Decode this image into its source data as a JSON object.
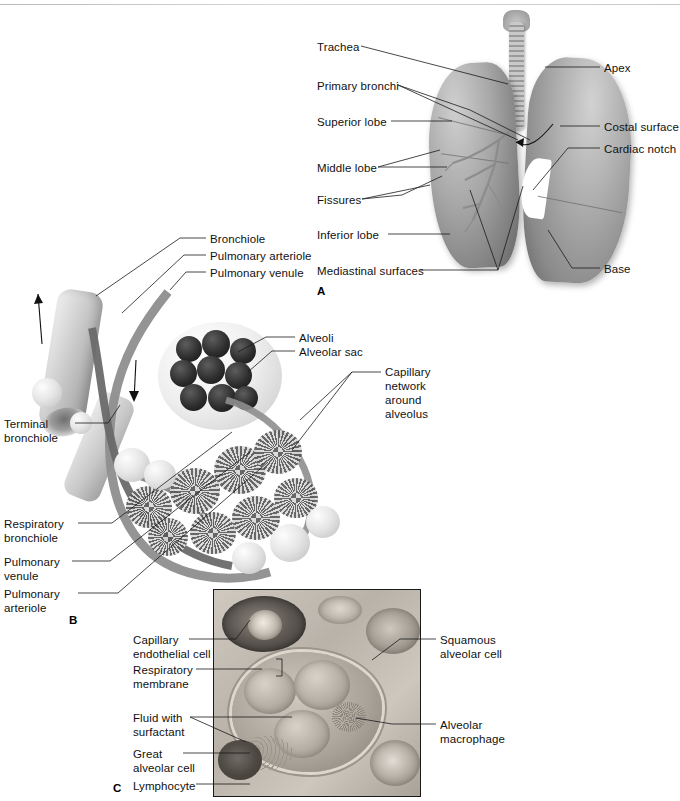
{
  "figure": {
    "panels": [
      {
        "letter": "A",
        "name": "gross-lung-anatomy"
      },
      {
        "letter": "B",
        "name": "alveolar-sac-and-capillary-network"
      },
      {
        "letter": "C",
        "name": "respiratory-membrane-micrograph"
      }
    ]
  },
  "panelA": {
    "letter": "A",
    "labels_left": [
      {
        "text": "Trachea"
      },
      {
        "text": "Primary bronchi"
      },
      {
        "text": "Superior lobe"
      },
      {
        "text": "Middle lobe"
      },
      {
        "text": "Fissures"
      },
      {
        "text": "Inferior lobe"
      },
      {
        "text": "Mediastinal surfaces"
      }
    ],
    "labels_right": [
      {
        "text": "Apex"
      },
      {
        "text": "Costal surface"
      },
      {
        "text": "Cardiac notch"
      },
      {
        "text": "Base"
      }
    ]
  },
  "panelB": {
    "letter": "B",
    "labels_top": [
      {
        "text": "Bronchiole"
      },
      {
        "text": "Pulmonary arteriole"
      },
      {
        "text": "Pulmonary venule"
      }
    ],
    "labels_mid": [
      {
        "text": "Alveoli"
      },
      {
        "text": "Alveolar sac"
      }
    ],
    "labels_left": [
      {
        "line1": "Terminal",
        "line2": "bronchiole"
      },
      {
        "line1": "Respiratory",
        "line2": "bronchiole"
      },
      {
        "line1": "Pulmonary",
        "line2": "venule"
      },
      {
        "line1": "Pulmonary",
        "line2": "arteriole"
      }
    ],
    "label_capillary": {
      "line1": "Capillary",
      "line2": "network",
      "line3": "around",
      "line4": "alveolus"
    }
  },
  "panelC": {
    "letter": "C",
    "labels_left": [
      {
        "line1": "Capillary",
        "line2": "endothelial cell"
      },
      {
        "line1": "Respiratory",
        "line2": "membrane"
      },
      {
        "line1": "Fluid with",
        "line2": "surfactant"
      },
      {
        "line1": "Great",
        "line2": "alveolar cell"
      },
      {
        "line1": "Lymphocyte",
        "line2": ""
      }
    ],
    "labels_right": [
      {
        "line1": "Squamous",
        "line2": "alveolar cell"
      },
      {
        "line1": "Alveolar",
        "line2": "macrophage"
      }
    ]
  },
  "colors": {
    "text": "#111111",
    "leader_line": "#1a1a1a",
    "background": "#ffffff"
  }
}
